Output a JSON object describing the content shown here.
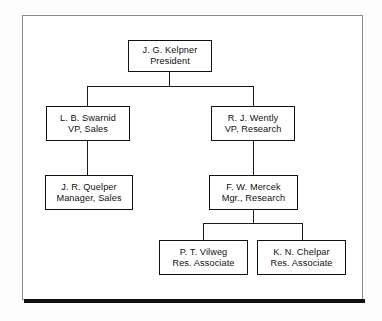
{
  "diagram": {
    "type": "organization-chart",
    "title": "",
    "frame": {
      "style": "bordered-box-with-drop-shadow"
    },
    "nodes": [
      {
        "id": "president",
        "name": "J. G. Kelpner",
        "title": "President",
        "level": 0
      },
      {
        "id": "vp-sales",
        "name": "L. B. Swarnid",
        "title": "VP, Sales",
        "level": 1
      },
      {
        "id": "vp-research",
        "name": "R. J. Wently",
        "title": "VP, Research",
        "level": 1
      },
      {
        "id": "mgr-sales",
        "name": "J. R. Quelper",
        "title": "Manager, Sales",
        "level": 2
      },
      {
        "id": "mgr-research",
        "name": "F. W. Mercek",
        "title": "Mgr., Research",
        "level": 2
      },
      {
        "id": "res-associate-1",
        "name": "P. T. Vilweg",
        "title": "Res. Associate",
        "level": 3
      },
      {
        "id": "res-associate-2",
        "name": "K. N. Chelpar",
        "title": "Res. Associate",
        "level": 3
      }
    ],
    "edges": [
      {
        "from": "president",
        "to": "vp-sales"
      },
      {
        "from": "president",
        "to": "vp-research"
      },
      {
        "from": "vp-sales",
        "to": "mgr-sales"
      },
      {
        "from": "vp-research",
        "to": "mgr-research"
      },
      {
        "from": "mgr-research",
        "to": "res-associate-1"
      },
      {
        "from": "mgr-research",
        "to": "res-associate-2"
      }
    ],
    "colors": {
      "box_border": "#111111",
      "box_fill": "#ffffff",
      "connector": "#1a1a1a",
      "frame_border": "#8a8a8a",
      "frame_shadow": "#101010",
      "page_background": "#fdfdfc"
    }
  }
}
